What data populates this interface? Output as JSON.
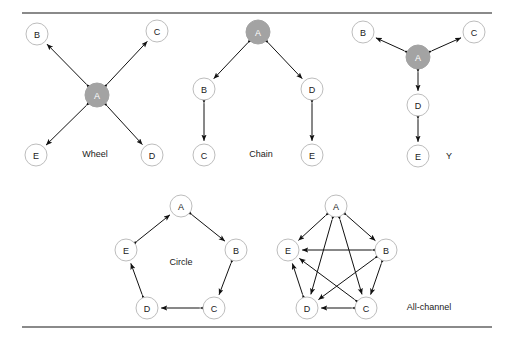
{
  "figure": {
    "background_color": "#ffffff",
    "rule_color": "#8a8a8a",
    "hub_node_color": "#a3a3a3",
    "node_fill_color": "#ffffff",
    "node_stroke_color": "#bdbdbd",
    "edge_color": "#111111"
  },
  "networks": [
    {
      "id": "wheel",
      "label": "Wheel",
      "label_x": 95,
      "label_y": 154,
      "hub": "A",
      "nodes": [
        {
          "id": "A",
          "label": "A",
          "x": 97,
          "y": 95,
          "r": 12,
          "hub": true
        },
        {
          "id": "B",
          "label": "B",
          "x": 37,
          "y": 34,
          "r": 11,
          "hub": false
        },
        {
          "id": "C",
          "label": "C",
          "x": 157,
          "y": 31,
          "r": 11,
          "hub": false
        },
        {
          "id": "D",
          "label": "D",
          "x": 152,
          "y": 155,
          "r": 11,
          "hub": false
        },
        {
          "id": "E",
          "label": "E",
          "x": 36,
          "y": 155,
          "r": 11,
          "hub": false
        }
      ],
      "edges": [
        {
          "from": "A",
          "to": "B"
        },
        {
          "from": "A",
          "to": "C"
        },
        {
          "from": "A",
          "to": "D"
        },
        {
          "from": "A",
          "to": "E"
        }
      ]
    },
    {
      "id": "chain",
      "label": "Chain",
      "label_x": 261,
      "label_y": 154,
      "hub": "A",
      "nodes": [
        {
          "id": "A",
          "label": "A",
          "x": 258,
          "y": 32,
          "r": 12,
          "hub": true
        },
        {
          "id": "B",
          "label": "B",
          "x": 204,
          "y": 89,
          "r": 11,
          "hub": false
        },
        {
          "id": "C",
          "label": "C",
          "x": 204,
          "y": 155,
          "r": 11,
          "hub": false
        },
        {
          "id": "D",
          "label": "D",
          "x": 312,
          "y": 89,
          "r": 11,
          "hub": false
        },
        {
          "id": "E",
          "label": "E",
          "x": 312,
          "y": 155,
          "r": 11,
          "hub": false
        }
      ],
      "edges": [
        {
          "from": "A",
          "to": "B"
        },
        {
          "from": "A",
          "to": "D"
        },
        {
          "from": "B",
          "to": "C"
        },
        {
          "from": "D",
          "to": "E"
        }
      ]
    },
    {
      "id": "y",
      "label": "Y",
      "label_x": 449,
      "label_y": 156,
      "hub": "A",
      "nodes": [
        {
          "id": "A",
          "label": "A",
          "x": 418,
          "y": 57,
          "r": 12,
          "hub": true
        },
        {
          "id": "B",
          "label": "B",
          "x": 363,
          "y": 32,
          "r": 11,
          "hub": false
        },
        {
          "id": "C",
          "label": "C",
          "x": 474,
          "y": 32,
          "r": 11,
          "hub": false
        },
        {
          "id": "D",
          "label": "D",
          "x": 418,
          "y": 105,
          "r": 11,
          "hub": false
        },
        {
          "id": "E",
          "label": "E",
          "x": 418,
          "y": 156,
          "r": 11,
          "hub": false
        }
      ],
      "edges": [
        {
          "from": "A",
          "to": "B"
        },
        {
          "from": "A",
          "to": "C"
        },
        {
          "from": "A",
          "to": "D"
        },
        {
          "from": "D",
          "to": "E"
        }
      ]
    },
    {
      "id": "circle",
      "label": "Circle",
      "label_x": 181,
      "label_y": 262,
      "hub": null,
      "nodes": [
        {
          "id": "A",
          "label": "A",
          "x": 181,
          "y": 206,
          "r": 11,
          "hub": false
        },
        {
          "id": "B",
          "label": "B",
          "x": 236,
          "y": 250,
          "r": 11,
          "hub": false
        },
        {
          "id": "C",
          "label": "C",
          "x": 214,
          "y": 308,
          "r": 11,
          "hub": false
        },
        {
          "id": "D",
          "label": "D",
          "x": 147,
          "y": 308,
          "r": 11,
          "hub": false
        },
        {
          "id": "E",
          "label": "E",
          "x": 126,
          "y": 250,
          "r": 11,
          "hub": false
        }
      ],
      "edges": [
        {
          "from": "A",
          "to": "B"
        },
        {
          "from": "B",
          "to": "C"
        },
        {
          "from": "C",
          "to": "D"
        },
        {
          "from": "D",
          "to": "E"
        },
        {
          "from": "E",
          "to": "A"
        }
      ]
    },
    {
      "id": "all-channel",
      "label": "All-channel",
      "label_x": 429,
      "label_y": 307,
      "hub": null,
      "nodes": [
        {
          "id": "A",
          "label": "A",
          "x": 336,
          "y": 206,
          "r": 11,
          "hub": false
        },
        {
          "id": "B",
          "label": "B",
          "x": 386,
          "y": 250,
          "r": 11,
          "hub": false
        },
        {
          "id": "C",
          "label": "C",
          "x": 366,
          "y": 308,
          "r": 11,
          "hub": false
        },
        {
          "id": "D",
          "label": "D",
          "x": 307,
          "y": 308,
          "r": 11,
          "hub": false
        },
        {
          "id": "E",
          "label": "E",
          "x": 288,
          "y": 250,
          "r": 11,
          "hub": false
        }
      ],
      "edges": [
        {
          "from": "A",
          "to": "B"
        },
        {
          "from": "A",
          "to": "C"
        },
        {
          "from": "A",
          "to": "D"
        },
        {
          "from": "A",
          "to": "E"
        },
        {
          "from": "B",
          "to": "C"
        },
        {
          "from": "B",
          "to": "D"
        },
        {
          "from": "B",
          "to": "E"
        },
        {
          "from": "C",
          "to": "D"
        },
        {
          "from": "C",
          "to": "E"
        },
        {
          "from": "D",
          "to": "E"
        }
      ]
    }
  ]
}
